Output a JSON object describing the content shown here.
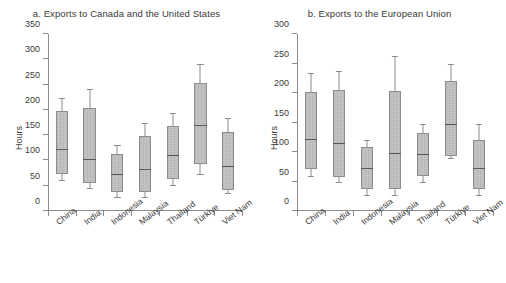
{
  "figure": {
    "ylabel": "Hours"
  },
  "chart_data": [
    {
      "type": "boxplot",
      "panel_id": "a",
      "title": "a. Exports to Canada and the United States",
      "xlabel": "",
      "ylabel": "Hours",
      "ylim": [
        0,
        350
      ],
      "yticks": [
        0,
        50,
        100,
        150,
        200,
        250,
        300,
        350
      ],
      "grid": false,
      "legend": "none",
      "categories": [
        "China",
        "India",
        "Indonesia",
        "Malaysia",
        "Thailand",
        "Türkiye",
        "Viet Nam"
      ],
      "boxes": [
        {
          "category": "China",
          "whisker_low": 59,
          "q1": 74,
          "median": 120,
          "q3": 197,
          "whisker_high": 222
        },
        {
          "category": "India",
          "whisker_low": 44,
          "q1": 55,
          "median": 101,
          "q3": 204,
          "whisker_high": 240
        },
        {
          "category": "Indonesia",
          "whisker_low": 25,
          "q1": 37,
          "median": 72,
          "q3": 112,
          "whisker_high": 128
        },
        {
          "category": "Malaysia",
          "whisker_low": 25,
          "q1": 37,
          "median": 81,
          "q3": 148,
          "whisker_high": 173
        },
        {
          "category": "Thailand",
          "whisker_low": 49,
          "q1": 63,
          "median": 109,
          "q3": 168,
          "whisker_high": 191
        },
        {
          "category": "Türkiye",
          "whisker_low": 72,
          "q1": 93,
          "median": 168,
          "q3": 253,
          "whisker_high": 289
        },
        {
          "category": "Viet Nam",
          "whisker_low": 34,
          "q1": 42,
          "median": 87,
          "q3": 156,
          "whisker_high": 181
        }
      ]
    },
    {
      "type": "boxplot",
      "panel_id": "b",
      "title": "b. Exports to the European Union",
      "xlabel": "",
      "ylabel": "Hours",
      "ylim": [
        0,
        300
      ],
      "yticks": [
        0,
        50,
        100,
        150,
        200,
        250,
        300
      ],
      "grid": false,
      "legend": "none",
      "categories": [
        "China",
        "India",
        "Indonesia",
        "Malaysia",
        "Thailand",
        "Türkiye",
        "Viet Nam"
      ],
      "boxes": [
        {
          "category": "China",
          "whisker_low": 58,
          "q1": 72,
          "median": 120,
          "q3": 201,
          "whisker_high": 232
        },
        {
          "category": "India",
          "whisker_low": 48,
          "q1": 58,
          "median": 114,
          "q3": 205,
          "whisker_high": 235
        },
        {
          "category": "Indonesia",
          "whisker_low": 25,
          "q1": 37,
          "median": 71,
          "q3": 108,
          "whisker_high": 119
        },
        {
          "category": "Malaysia",
          "whisker_low": 25,
          "q1": 37,
          "median": 96,
          "q3": 204,
          "whisker_high": 261
        },
        {
          "category": "Thailand",
          "whisker_low": 48,
          "q1": 60,
          "median": 95,
          "q3": 132,
          "whisker_high": 145
        },
        {
          "category": "Türkiye",
          "whisker_low": 88,
          "q1": 94,
          "median": 145,
          "q3": 220,
          "whisker_high": 248
        },
        {
          "category": "Viet Nam",
          "whisker_low": 25,
          "q1": 37,
          "median": 71,
          "q3": 120,
          "whisker_high": 145
        }
      ]
    }
  ]
}
